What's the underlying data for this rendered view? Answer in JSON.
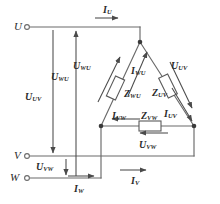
{
  "figure": {
    "line_color": "#555555",
    "text_color": "#2b2b2b",
    "background": "#ffffff"
  },
  "terminals": [
    {
      "name": "terminal-u",
      "label": "U",
      "x": 14,
      "y": 21
    },
    {
      "name": "terminal-v",
      "label": "V",
      "x": 14,
      "y": 150
    },
    {
      "name": "terminal-w",
      "label": "W",
      "x": 10,
      "y": 172
    }
  ],
  "line_currents": [
    {
      "name": "current-iu",
      "symbol": "I",
      "subscript": "U",
      "x": 103,
      "y": 7
    },
    {
      "name": "current-iv",
      "symbol": "I",
      "subscript": "V",
      "x": 131,
      "y": 178
    },
    {
      "name": "current-iw",
      "symbol": "I",
      "subscript": "W",
      "x": 74,
      "y": 186
    }
  ],
  "line_voltages": [
    {
      "name": "voltage-uuv",
      "symbol": "U",
      "subscript": "UV",
      "x": 25,
      "y": 94
    },
    {
      "name": "voltage-uwu",
      "symbol": "U",
      "subscript": "WU",
      "x": 51,
      "y": 74
    },
    {
      "name": "voltage-uvw",
      "symbol": "U",
      "subscript": "VW",
      "x": 36,
      "y": 163
    }
  ],
  "phase_voltages": [
    {
      "name": "voltage-uwu-phase",
      "symbol": "U",
      "subscript": "WU",
      "x": 75,
      "y": 63
    },
    {
      "name": "voltage-uuv-phase",
      "symbol": "U",
      "subscript": "UV",
      "x": 171,
      "y": 63
    },
    {
      "name": "voltage-uvw-phase",
      "symbol": "U",
      "subscript": "VW",
      "x": 139,
      "y": 142
    }
  ],
  "phase_currents": [
    {
      "name": "current-iwu",
      "symbol": "I",
      "subscript": "WU",
      "x": 131,
      "y": 68
    },
    {
      "name": "current-iuv",
      "symbol": "I",
      "subscript": "UV",
      "x": 167,
      "y": 111
    },
    {
      "name": "current-ivw",
      "symbol": "I",
      "subscript": "VW",
      "x": 123,
      "y": 113
    }
  ],
  "impedances": [
    {
      "name": "impedance-zwu",
      "symbol": "Z",
      "subscript": "WU",
      "x": 124,
      "y": 90
    },
    {
      "name": "impedance-zuv",
      "symbol": "Z",
      "subscript": "UV",
      "x": 154,
      "y": 89
    },
    {
      "name": "impedance-zvw",
      "symbol": "Z",
      "subscript": "VW",
      "x": 147,
      "y": 113
    }
  ]
}
